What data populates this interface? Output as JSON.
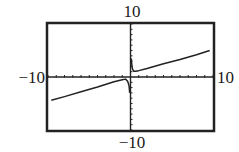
{
  "chart_data": {
    "type": "line",
    "title": "",
    "xlabel": "",
    "ylabel": "",
    "xlim": [
      -10,
      10
    ],
    "ylim": [
      -10,
      10
    ],
    "xscale": 1,
    "yscale": 1,
    "grid": false,
    "axis_labels": {
      "xmin": "−10",
      "xmax": "10",
      "ymin": "−10",
      "ymax": "10"
    },
    "vertical_asymptote_x": 0,
    "series": [
      {
        "name": "left-branch",
        "x": [
          -9.6,
          -8,
          -6,
          -4,
          -2,
          -1,
          -0.6,
          -0.4,
          -0.3,
          -0.2,
          -0.15,
          -0.1
        ],
        "y": [
          -4.4,
          -3.7,
          -2.8,
          -1.9,
          -0.9,
          -0.5,
          -0.4,
          -0.7,
          -1.0,
          -1.5,
          -2.0,
          -3.0
        ]
      },
      {
        "name": "right-branch",
        "x": [
          0.1,
          0.15,
          0.2,
          0.3,
          0.4,
          0.6,
          1,
          2,
          4,
          6,
          8,
          9.6
        ],
        "y": [
          3.5,
          2.5,
          1.8,
          1.3,
          1.1,
          1.1,
          1.2,
          1.6,
          2.5,
          3.3,
          4.2,
          5.0
        ]
      }
    ],
    "colors": {
      "curve": "#222222",
      "axes": "#222222",
      "frame": "#222222",
      "background": "#ffffff"
    }
  }
}
